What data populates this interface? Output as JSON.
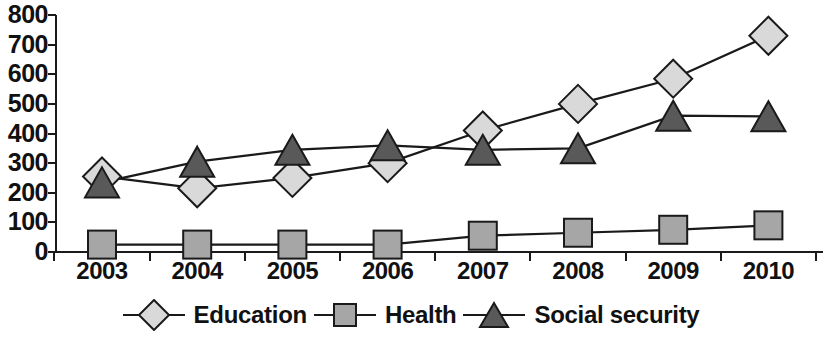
{
  "chart_data": {
    "type": "line",
    "title": "",
    "subtitle": "",
    "xlabel": "",
    "ylabel": "",
    "categories": [
      "2003",
      "2004",
      "2005",
      "2006",
      "2007",
      "2008",
      "2009",
      "2010"
    ],
    "ylim": [
      0,
      800
    ],
    "yticks": [
      800,
      700,
      600,
      500,
      400,
      300,
      200,
      100,
      0
    ],
    "grid": false,
    "legend_position": "bottom",
    "series": [
      {
        "name": "Education",
        "marker": "diamond",
        "color": "#d9d9d9",
        "line_color": "#1a1a1a",
        "values": [
          255,
          215,
          250,
          300,
          410,
          500,
          585,
          730
        ]
      },
      {
        "name": "Health",
        "marker": "square",
        "color": "#a6a6a6",
        "line_color": "#1a1a1a",
        "values": [
          25,
          25,
          25,
          25,
          55,
          65,
          75,
          90
        ]
      },
      {
        "name": "Social security",
        "marker": "triangle",
        "color": "#595959",
        "line_color": "#1a1a1a",
        "values": [
          235,
          305,
          345,
          360,
          345,
          350,
          460,
          458
        ]
      }
    ]
  },
  "legend": {
    "items": [
      {
        "label": "Education"
      },
      {
        "label": "Health"
      },
      {
        "label": "Social security"
      }
    ]
  },
  "axis": {
    "y_labels": [
      "800",
      "700",
      "600",
      "500",
      "400",
      "300",
      "200",
      "100",
      "0"
    ],
    "x_labels": [
      "2003",
      "2004",
      "2005",
      "2006",
      "2007",
      "2008",
      "2009",
      "2010"
    ]
  }
}
